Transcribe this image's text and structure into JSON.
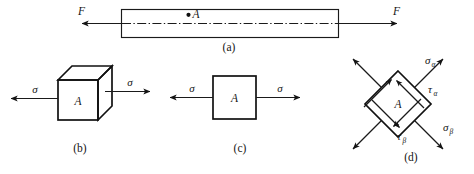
{
  "figure": {
    "background_color": "#ffffff",
    "line_color": "#1a1a1a",
    "panels": [
      {
        "id": "a",
        "caption": "(a)",
        "description": "axially loaded bar with centerline and point A",
        "point_label": "A",
        "force_left_label": "F",
        "force_right_label": "F"
      },
      {
        "id": "b",
        "caption": "(b)",
        "description": "isometric cube element with area A under normal stress",
        "area_label": "A",
        "stress_left_label": "σ",
        "stress_right_label": "σ"
      },
      {
        "id": "c",
        "caption": "(c)",
        "description": "plane square element with area A under normal stress",
        "area_label": "A",
        "stress_left_label": "σ",
        "stress_right_label": "σ"
      },
      {
        "id": "d",
        "caption": "(d)",
        "description": "rotated (inclined) square element showing normal and shear stresses on oblique planes",
        "area_label": "A",
        "sigma_alpha_label": "σ",
        "sigma_alpha_sub": "α",
        "tau_alpha_label": "τ",
        "tau_alpha_sub": "α",
        "sigma_beta_label": "σ",
        "sigma_beta_sub": "β",
        "tau_beta_label": "τ",
        "tau_beta_sub": "β"
      }
    ]
  }
}
